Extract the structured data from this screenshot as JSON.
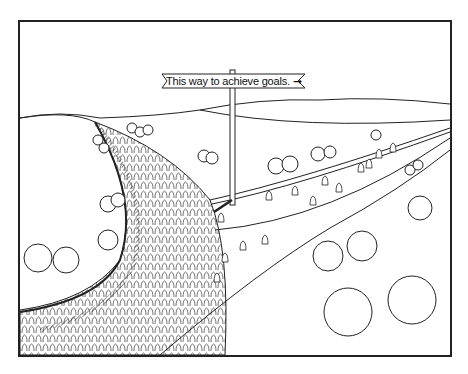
{
  "cartoon": {
    "sign": {
      "text": "This way to achieve goals.",
      "arrow": "arrow-right-icon"
    },
    "scene": {
      "crowd_path": "crowded road of many people",
      "empty_path": "sparse road with few people following the sign",
      "colors": {
        "ink": "#222222",
        "paper": "#ffffff"
      }
    }
  }
}
